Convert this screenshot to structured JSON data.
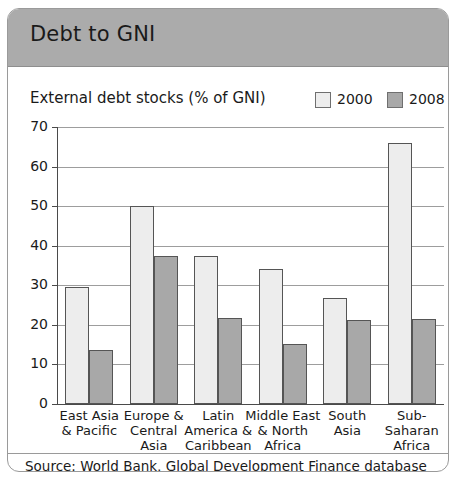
{
  "header": {
    "title": "Debt to GNI"
  },
  "source": {
    "text": "Source: World Bank, Global Development Finance database"
  },
  "chart_data": {
    "type": "bar",
    "title": "External debt stocks (% of GNI)",
    "xlabel": "",
    "ylabel": "",
    "ylim": [
      0,
      70
    ],
    "yticks": [
      0,
      10,
      20,
      30,
      40,
      50,
      60,
      70
    ],
    "grid": true,
    "legend_position": "top-right",
    "categories": [
      "East Asia\n& Pacific",
      "Europe &\nCentral\nAsia",
      "Latin\nAmerica &\nCaribbean",
      "Middle East\n& North\nAfrica",
      "South\nAsia",
      "Sub-\nSaharan\nAfrica"
    ],
    "category_lines": [
      [
        "East Asia",
        "& Pacific"
      ],
      [
        "Europe &",
        "Central",
        "Asia"
      ],
      [
        "Latin",
        "America &",
        "Caribbean"
      ],
      [
        "Middle East",
        "& North",
        "Africa"
      ],
      [
        "South",
        "Asia"
      ],
      [
        "Sub-",
        "Saharan",
        "Africa"
      ]
    ],
    "series": [
      {
        "name": "2000",
        "color": "#ededed",
        "values": [
          29.5,
          50.0,
          37.5,
          34.0,
          26.7,
          66.0
        ]
      },
      {
        "name": "2008",
        "color": "#a8a8a8",
        "values": [
          13.7,
          37.5,
          21.8,
          15.2,
          21.3,
          21.5
        ]
      }
    ]
  }
}
